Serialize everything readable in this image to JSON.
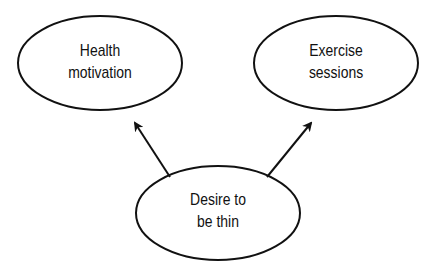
{
  "diagram": {
    "type": "concept-diagram",
    "nodes": [
      {
        "id": "health",
        "line1": "Health",
        "line2": "motivation"
      },
      {
        "id": "exercise",
        "line1": "Exercise",
        "line2": "sessions"
      },
      {
        "id": "desire",
        "line1": "Desire to",
        "line2": "be thin"
      }
    ],
    "edges": [
      {
        "from": "desire",
        "to": "health"
      },
      {
        "from": "desire",
        "to": "exercise"
      }
    ],
    "colors": {
      "stroke": "#111111",
      "background": "#ffffff"
    }
  }
}
